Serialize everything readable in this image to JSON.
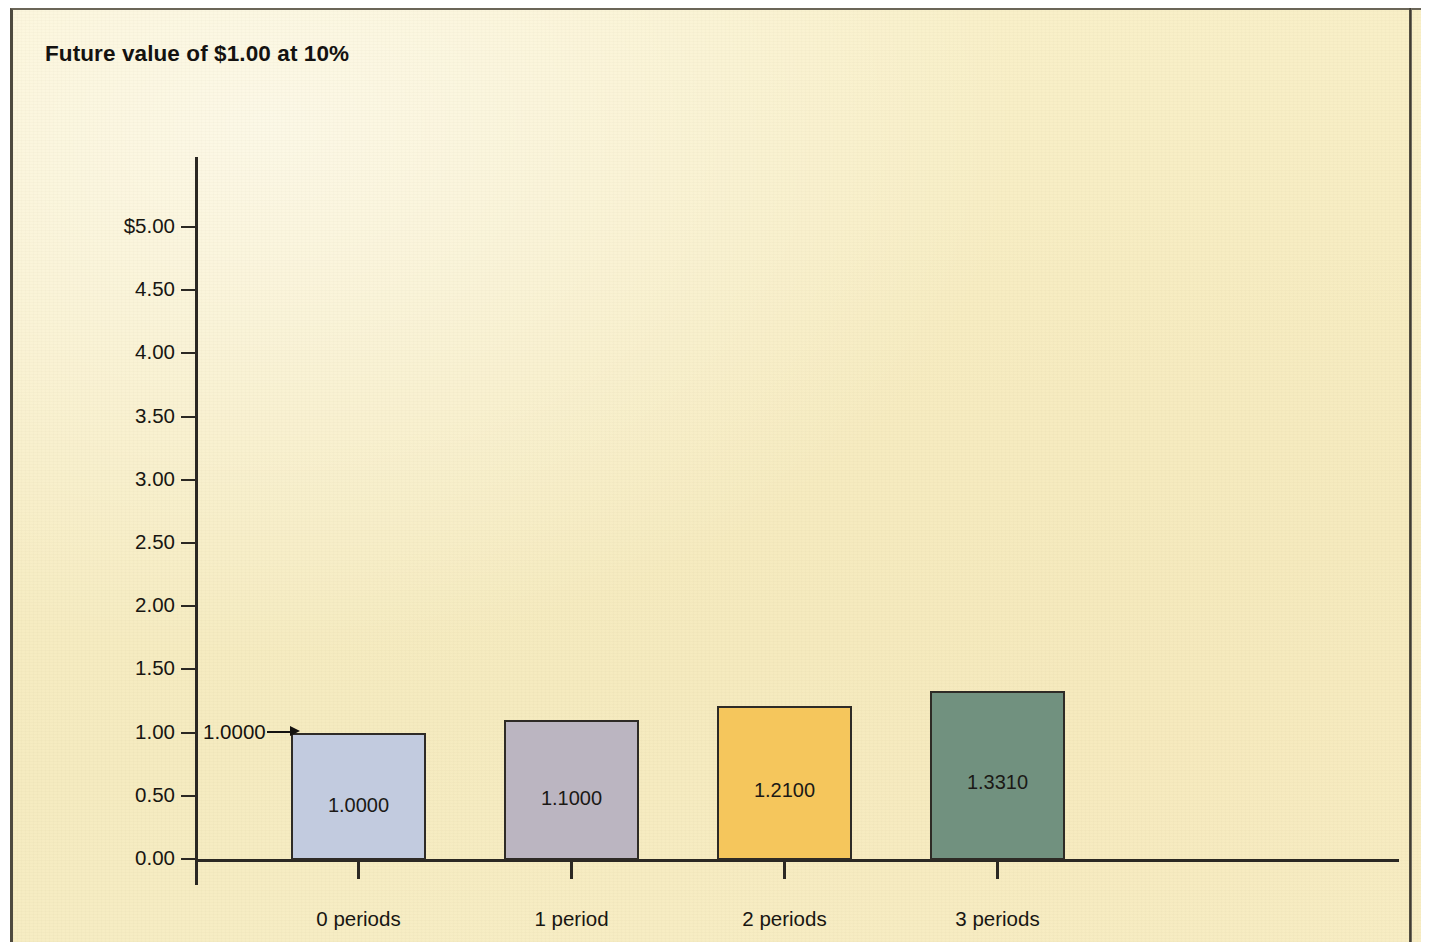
{
  "figure": {
    "title": "Future value of $1.00 at 10%",
    "background_color": "#f7edc3",
    "border_color": "#4e4a3f"
  },
  "chart_data": {
    "type": "bar",
    "title": "Future value of $1.00 at 10%",
    "xlabel": "",
    "ylabel": "",
    "categories": [
      "0 periods",
      "1 period",
      "2 periods",
      "3 periods"
    ],
    "values": [
      1.0,
      1.1,
      1.21,
      1.331
    ],
    "value_labels": [
      "1.0000",
      "1.1000",
      "1.2100",
      "1.3310"
    ],
    "bar_colors": [
      "#c2cbdf",
      "#bbb5c1",
      "#f5c65c",
      "#71917f"
    ],
    "bar_edge_color": "#2e2b26",
    "ylim": [
      0.0,
      5.0
    ],
    "ytick_labels": [
      "0.00",
      "0.50",
      "1.00",
      "1.50",
      "2.00",
      "2.50",
      "3.00",
      "3.50",
      "4.00",
      "4.50",
      "$5.00"
    ],
    "ytick_values": [
      0.0,
      0.5,
      1.0,
      1.5,
      2.0,
      2.5,
      3.0,
      3.5,
      4.0,
      4.5,
      5.0
    ],
    "grid": false,
    "legend": null,
    "annotations": [
      {
        "text": "1.0000",
        "icon": "right-arrow-icon",
        "points_to_category": "0 periods",
        "points_to_value": 1.0
      }
    ]
  }
}
